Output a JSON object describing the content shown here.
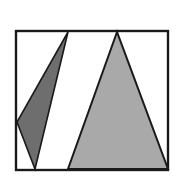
{
  "figure": {
    "title": "Two overlapping triangles inside a square frame",
    "canvas": {
      "width": 176,
      "height": 190,
      "background_color": "#ffffff"
    },
    "frame": {
      "label": "square-frame",
      "x": 16,
      "y": 31,
      "width": 152,
      "height": 139,
      "fill_color": "#ffffff",
      "stroke_color": "#1a1a1a",
      "stroke_width": 2.2
    },
    "shapes": [
      {
        "name": "small-dark-triangle",
        "kind": "triangle",
        "fill_color": "#6e6e6e",
        "stroke_color": "#1a1a1a",
        "stroke_width": 1.6,
        "points": "68,32 17,122 35,169",
        "vertices": [
          {
            "label": "apex-top",
            "x": 68,
            "y": 32
          },
          {
            "label": "left-mid",
            "x": 17,
            "y": 122
          },
          {
            "label": "base-bottom",
            "x": 35,
            "y": 169
          }
        ]
      },
      {
        "name": "large-gray-triangle",
        "kind": "triangle",
        "fill_color": "#a9a9a9",
        "stroke_color": "#1a1a1a",
        "stroke_width": 2.0,
        "points": "117,32 68,169 168,169",
        "vertices": [
          {
            "label": "apex-top",
            "x": 117,
            "y": 32
          },
          {
            "label": "base-left",
            "x": 68,
            "y": 169
          },
          {
            "label": "base-right",
            "x": 168,
            "y": 169
          }
        ]
      }
    ],
    "colors": {
      "dark_gray": "#6e6e6e",
      "light_gray": "#a9a9a9",
      "outline": "#1a1a1a",
      "background": "#ffffff"
    }
  }
}
